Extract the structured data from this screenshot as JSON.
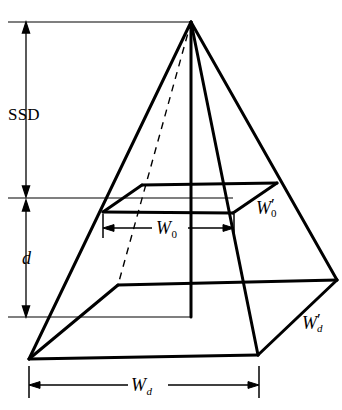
{
  "diagram": {
    "type": "technical-line-diagram",
    "background_color": "#ffffff",
    "stroke_color": "#000000",
    "canvas": {
      "width": 342,
      "height": 410
    },
    "labels": {
      "ssd": "SSD",
      "depth": "d",
      "w0_base": "W",
      "w0_sub": "0",
      "w0_prime_base": "W",
      "w0_prime_sub": "0",
      "w0_prime_mark": "′",
      "wd_base": "W",
      "wd_sub": "d",
      "wd_prime_base": "W",
      "wd_prime_sub": "d",
      "wd_prime_mark": "′"
    },
    "geometry": {
      "apex": [
        191,
        22
      ],
      "mid_plane": {
        "front_left": [
          103,
          212
        ],
        "front_right": [
          233,
          213
        ],
        "back_right": [
          277,
          183
        ],
        "back_left": [
          142,
          185
        ]
      },
      "bottom_plane": {
        "front_left": [
          29,
          359
        ],
        "front_right": [
          258,
          355
        ],
        "back_right": [
          337,
          280
        ],
        "back_left": [
          118,
          285
        ]
      },
      "hidden_edge_dashed": [
        [
          191,
          22
        ],
        [
          118,
          285
        ]
      ],
      "central_axis": [
        [
          191,
          22
        ],
        [
          191,
          317
        ]
      ]
    },
    "dimensions": {
      "ssd": {
        "axis": "vertical",
        "x": 26,
        "y_start": 22,
        "y_end": 197
      },
      "d": {
        "axis": "vertical",
        "x": 26,
        "y_start": 200,
        "y_end": 317
      },
      "w0": {
        "axis": "horizontal",
        "y": 228,
        "x_start": 103,
        "x_end": 234
      },
      "wd": {
        "axis": "horizontal",
        "y": 385,
        "x_start": 29,
        "x_end": 259
      }
    },
    "reference_lines": [
      {
        "name": "top-reference",
        "y": 22,
        "x_start": 8,
        "x_end": 191
      },
      {
        "name": "ssd-plane-reference",
        "y": 198,
        "x_start": 8,
        "x_end": 233
      },
      {
        "name": "depth-plane-reference",
        "y": 317,
        "x_start": 8,
        "x_end": 191
      }
    ]
  }
}
